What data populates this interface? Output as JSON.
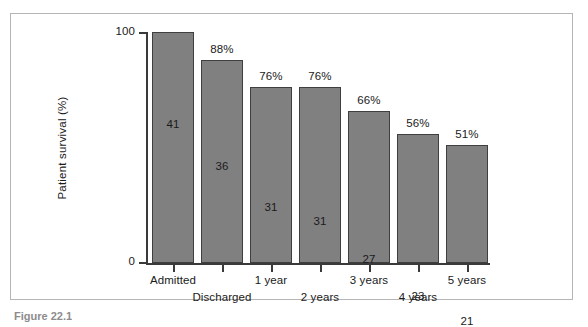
{
  "figure": {
    "caption": "Figure 22.1"
  },
  "chart_data": {
    "type": "bar",
    "title": "",
    "xlabel": "",
    "ylabel": "Patient survival (%)",
    "ylim": [
      0,
      100
    ],
    "y_ticks": [
      "0",
      "100"
    ],
    "grid": false,
    "legend": "none",
    "categories": [
      "Admitted",
      "Discharged",
      "1 year",
      "2 years",
      "3 years",
      "4 years",
      "5 years"
    ],
    "category_label_row": [
      0,
      1,
      0,
      1,
      0,
      1,
      0
    ],
    "values": [
      100,
      88,
      76,
      76,
      66,
      56,
      51
    ],
    "percent_labels": [
      "",
      "88%",
      "76%",
      "76%",
      "66%",
      "56%",
      "51%"
    ],
    "counts": [
      41,
      36,
      31,
      31,
      27,
      23,
      21
    ],
    "count_labels": [
      "41",
      "36",
      "31",
      "31",
      "27",
      "23",
      "21"
    ],
    "bar_color": "#808080",
    "bar_border_color": "#3f3f3f",
    "axis_color": "#3a3a3a",
    "text_color": "#1a1a1a"
  }
}
